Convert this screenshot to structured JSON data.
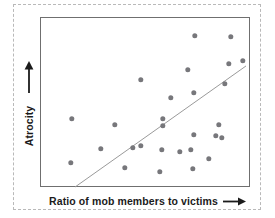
{
  "chart_data": {
    "type": "scatter",
    "title": "",
    "xlabel": "Ratio of mob members to victims",
    "ylabel": "Atrocity",
    "xlabel_arrow": "right-arrow",
    "ylabel_arrow": "up-arrow",
    "grid": false,
    "legend": null,
    "axis_ticks": false,
    "xlim": [
      0,
      100
    ],
    "ylim": [
      0,
      100
    ],
    "point_color": "#77777b",
    "frame_color": "#6f6f6f",
    "trendline_color": "#9a9a9a",
    "border_color": "#b9b9b9",
    "points": [
      {
        "x": 14.8,
        "y": 14.1
      },
      {
        "x": 15.2,
        "y": 40.0
      },
      {
        "x": 29.0,
        "y": 22.4
      },
      {
        "x": 48.1,
        "y": 62.9
      },
      {
        "x": 40.5,
        "y": 11.2
      },
      {
        "x": 44.3,
        "y": 22.9
      },
      {
        "x": 48.1,
        "y": 24.1
      },
      {
        "x": 57.1,
        "y": 8.8
      },
      {
        "x": 58.1,
        "y": 21.8
      },
      {
        "x": 58.6,
        "y": 35.9
      },
      {
        "x": 58.6,
        "y": 40.0
      },
      {
        "x": 72.9,
        "y": 10.6
      },
      {
        "x": 71.9,
        "y": 21.8
      },
      {
        "x": 73.3,
        "y": 30.6
      },
      {
        "x": 73.3,
        "y": 55.3
      },
      {
        "x": 70.5,
        "y": 68.8
      },
      {
        "x": 73.8,
        "y": 88.8
      },
      {
        "x": 83.8,
        "y": 30.0
      },
      {
        "x": 85.2,
        "y": 36.5
      },
      {
        "x": 86.7,
        "y": 28.8
      },
      {
        "x": 88.1,
        "y": 60.6
      },
      {
        "x": 90.0,
        "y": 72.4
      },
      {
        "x": 91.0,
        "y": 88.2
      },
      {
        "x": 96.7,
        "y": 74.1
      },
      {
        "x": 62.4,
        "y": 52.4
      },
      {
        "x": 35.7,
        "y": 36.5
      },
      {
        "x": 66.7,
        "y": 20.6
      },
      {
        "x": 80.5,
        "y": 16.5
      }
    ],
    "trendline": {
      "x0": 16.7,
      "y0": 0.0,
      "x1": 98.1,
      "y1": 71.2
    }
  }
}
